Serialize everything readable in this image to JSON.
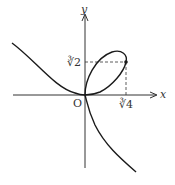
{
  "diagram": {
    "type": "curve-plot",
    "axes": {
      "x_label": "x",
      "y_label": "y",
      "origin_label": "O"
    },
    "ticks": {
      "x_tick_label": "∛4",
      "y_tick_label": "∛2"
    },
    "marked_point": {
      "x": "∛4",
      "y": "∛2"
    },
    "colors": {
      "curve": "#1a1a1a",
      "axes": "#333333",
      "dashed": "#333333",
      "background": "#ffffff"
    }
  }
}
